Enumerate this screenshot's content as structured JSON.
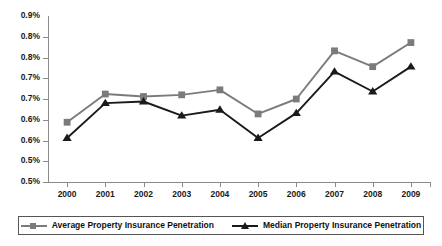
{
  "chart_data": {
    "type": "line",
    "title": "",
    "xlabel": "",
    "ylabel": "",
    "grid": false,
    "legend_position": "bottom",
    "categories": [
      "2000",
      "2001",
      "2002",
      "2003",
      "2004",
      "2005",
      "2006",
      "2007",
      "2008",
      "2009"
    ],
    "ylim": [
      0.5,
      0.9
    ],
    "ytick_values": [
      0.5,
      0.55,
      0.6,
      0.65,
      0.7,
      0.75,
      0.8,
      0.85,
      0.9
    ],
    "ytick_labels": [
      "0.5%",
      "0.6%",
      "0.6%",
      "0.7%",
      "0.7%",
      "0.8%",
      "0.8%",
      "0.9%"
    ],
    "yticks": [
      {
        "value": 0.9,
        "label": "0.9%"
      },
      {
        "value": 0.85,
        "label": "0.8%"
      },
      {
        "value": 0.8,
        "label": "0.8%"
      },
      {
        "value": 0.75,
        "label": "0.7%"
      },
      {
        "value": 0.7,
        "label": "0.7%"
      },
      {
        "value": 0.65,
        "label": "0.6%"
      },
      {
        "value": 0.6,
        "label": "0.6%"
      },
      {
        "value": 0.55,
        "label": "0.5%"
      }
    ],
    "series": [
      {
        "name": "Average Property Insurance Penetration",
        "color": "#7b7b7b",
        "marker": "square",
        "values": [
          0.644,
          0.712,
          0.706,
          0.71,
          0.722,
          0.664,
          0.7,
          0.816,
          0.778,
          0.836
        ]
      },
      {
        "name": "Median Property Insurance Penetration",
        "color": "#1a1a1a",
        "marker": "triangle",
        "values": [
          0.606,
          0.69,
          0.694,
          0.66,
          0.674,
          0.606,
          0.666,
          0.766,
          0.718,
          0.778
        ]
      }
    ]
  },
  "legend": {
    "entries": [
      {
        "label": "Average Property Insurance Penetration",
        "color": "#7b7b7b",
        "marker": "square"
      },
      {
        "label": "Median Property Insurance Penetration",
        "color": "#1a1a1a",
        "marker": "triangle"
      }
    ]
  },
  "colors": {
    "average_series": "#7b7b7b",
    "median_series": "#1a1a1a",
    "axis": "#8a8a8a",
    "text": "#1a1a1a",
    "background": "#ffffff"
  }
}
